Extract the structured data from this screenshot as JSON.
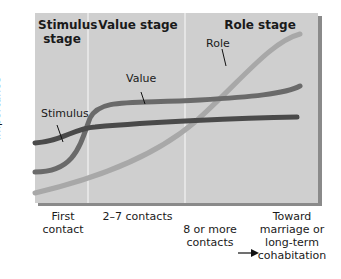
{
  "stages": [
    {
      "label": "Stimulus\nstage"
    },
    {
      "label": "Value stage"
    },
    {
      "label": "Role stage"
    }
  ],
  "y_axis_label": "Importance",
  "x_ticks": [
    {
      "label": "First\ncontact"
    },
    {
      "label": "2–7 contacts"
    },
    {
      "label": "8 or more\ncontacts"
    },
    {
      "label": "Toward\nmarriage or\nlong-term\ncohabitation"
    }
  ],
  "curves": [
    {
      "name": "Stimulus",
      "color": "#4a4a4a"
    },
    {
      "name": "Value",
      "color": "#6a6a6a"
    },
    {
      "name": "Role",
      "color": "#a8a8a8"
    }
  ],
  "colors": {
    "plot_bg": "#cfcfcf",
    "divider": "#f2f2f2",
    "shadow": "#8a8a8a"
  }
}
